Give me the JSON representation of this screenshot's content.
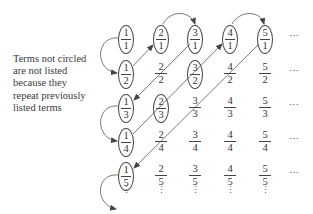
{
  "caption": {
    "lines": [
      "Terms not circled",
      "are not listed",
      "because they",
      "repeat previously",
      "listed terms"
    ]
  },
  "grid": {
    "rows": [
      [
        {
          "num": "1",
          "den": "1",
          "circled": true
        },
        {
          "num": "2",
          "den": "1",
          "circled": true
        },
        {
          "num": "3",
          "den": "1",
          "circled": true
        },
        {
          "num": "4",
          "den": "1",
          "circled": true
        },
        {
          "num": "5",
          "den": "1",
          "circled": true
        }
      ],
      [
        {
          "num": "1",
          "den": "2",
          "circled": true
        },
        {
          "num": "2",
          "den": "2",
          "circled": false
        },
        {
          "num": "3",
          "den": "2",
          "circled": true
        },
        {
          "num": "4",
          "den": "2",
          "circled": false
        },
        {
          "num": "5",
          "den": "2",
          "circled": false
        }
      ],
      [
        {
          "num": "1",
          "den": "3",
          "circled": true
        },
        {
          "num": "2",
          "den": "3",
          "circled": true
        },
        {
          "num": "3",
          "den": "3",
          "circled": false
        },
        {
          "num": "4",
          "den": "3",
          "circled": false
        },
        {
          "num": "5",
          "den": "3",
          "circled": false
        }
      ],
      [
        {
          "num": "1",
          "den": "4",
          "circled": true
        },
        {
          "num": "2",
          "den": "4",
          "circled": false
        },
        {
          "num": "3",
          "den": "4",
          "circled": false
        },
        {
          "num": "4",
          "den": "4",
          "circled": false
        },
        {
          "num": "5",
          "den": "4",
          "circled": false
        }
      ],
      [
        {
          "num": "1",
          "den": "5",
          "circled": true
        },
        {
          "num": "2",
          "den": "5",
          "circled": false
        },
        {
          "num": "3",
          "den": "5",
          "circled": false
        },
        {
          "num": "4",
          "den": "5",
          "circled": false
        },
        {
          "num": "5",
          "den": "5",
          "circled": false
        }
      ]
    ],
    "row_ellipsis": "⋯",
    "col_ellipsis": "⋮"
  },
  "path": {
    "description": "Diagonal zig-zag enumeration of positive rationals",
    "order": [
      "1/1",
      "1/2",
      "2/1",
      "3/1",
      "2/2",
      "1/3",
      "1/4",
      "2/3",
      "3/2",
      "4/1",
      "5/1",
      "4/2",
      "3/3",
      "2/4",
      "1/5"
    ],
    "arrow_color": "#444444"
  }
}
